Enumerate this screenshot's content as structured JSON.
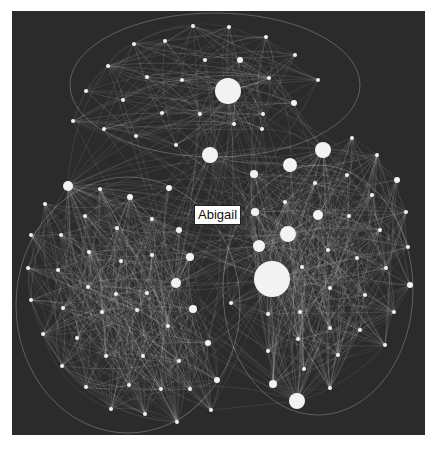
{
  "figure": {
    "background_color": "#2b2b2b",
    "page_color": "#ffffff",
    "edge_color": "#e8e8e8",
    "node_color": "#f2f2f2",
    "highlight_label": {
      "text": "Abigail",
      "x": 194,
      "y": 205
    }
  },
  "clusters": [
    {
      "name": "top-cluster",
      "hull": {
        "cx": 215,
        "cy": 85,
        "rx": 145,
        "ry": 72
      },
      "nodes": [
        [
          193,
          26,
          2
        ],
        [
          229,
          27,
          2
        ],
        [
          266,
          37,
          2
        ],
        [
          134,
          44,
          2
        ],
        [
          165,
          41,
          2
        ],
        [
          240,
          60,
          3
        ],
        [
          205,
          60,
          2
        ],
        [
          295,
          55,
          2
        ],
        [
          108,
          66,
          2
        ],
        [
          147,
          77,
          2
        ],
        [
          182,
          80,
          2
        ],
        [
          228,
          91,
          13
        ],
        [
          269,
          78,
          2
        ],
        [
          318,
          80,
          2
        ],
        [
          86,
          91,
          2
        ],
        [
          123,
          100,
          2
        ],
        [
          162,
          113,
          2
        ],
        [
          200,
          114,
          2
        ],
        [
          234,
          124,
          2
        ],
        [
          263,
          114,
          2
        ],
        [
          294,
          103,
          3
        ],
        [
          73,
          121,
          2
        ],
        [
          104,
          129,
          2
        ],
        [
          136,
          136,
          2
        ],
        [
          176,
          145,
          2
        ],
        [
          210,
          155,
          8
        ],
        [
          262,
          129,
          2
        ]
      ]
    },
    {
      "name": "right-cluster",
      "hull": {
        "cx": 318,
        "cy": 290,
        "rx": 95,
        "ry": 125
      },
      "nodes": [
        [
          323,
          150,
          8
        ],
        [
          352,
          138,
          2
        ],
        [
          377,
          155,
          2
        ],
        [
          290,
          165,
          7
        ],
        [
          254,
          174,
          4
        ],
        [
          347,
          175,
          2
        ],
        [
          315,
          183,
          2
        ],
        [
          397,
          180,
          3
        ],
        [
          372,
          195,
          2
        ],
        [
          285,
          202,
          2
        ],
        [
          318,
          215,
          5
        ],
        [
          255,
          212,
          4
        ],
        [
          349,
          216,
          2
        ],
        [
          406,
          212,
          2
        ],
        [
          288,
          234,
          8
        ],
        [
          259,
          246,
          6
        ],
        [
          380,
          230,
          2
        ],
        [
          408,
          247,
          2
        ],
        [
          328,
          250,
          2
        ],
        [
          302,
          267,
          2
        ],
        [
          357,
          258,
          2
        ],
        [
          386,
          268,
          2
        ],
        [
          272,
          279,
          18
        ],
        [
          410,
          285,
          3
        ],
        [
          330,
          288,
          2
        ],
        [
          365,
          295,
          2
        ],
        [
          300,
          312,
          2
        ],
        [
          268,
          314,
          2
        ],
        [
          394,
          312,
          2
        ],
        [
          231,
          303,
          2
        ],
        [
          330,
          328,
          2
        ],
        [
          360,
          330,
          2
        ],
        [
          298,
          339,
          2
        ],
        [
          385,
          345,
          2
        ],
        [
          268,
          351,
          2
        ],
        [
          338,
          355,
          2
        ],
        [
          304,
          369,
          2
        ],
        [
          273,
          384,
          4
        ],
        [
          330,
          388,
          2
        ],
        [
          297,
          401,
          8
        ]
      ]
    },
    {
      "name": "left-cluster",
      "hull": {
        "cx": 128,
        "cy": 305,
        "rx": 112,
        "ry": 128
      },
      "nodes": [
        [
          68,
          186,
          5
        ],
        [
          100,
          189,
          2
        ],
        [
          130,
          197,
          3
        ],
        [
          169,
          188,
          3
        ],
        [
          45,
          204,
          2
        ],
        [
          85,
          216,
          2
        ],
        [
          117,
          228,
          2
        ],
        [
          152,
          219,
          2
        ],
        [
          179,
          230,
          3
        ],
        [
          31,
          235,
          2
        ],
        [
          61,
          235,
          2
        ],
        [
          89,
          252,
          2
        ],
        [
          121,
          261,
          2
        ],
        [
          152,
          255,
          2
        ],
        [
          190,
          257,
          4
        ],
        [
          28,
          268,
          2
        ],
        [
          58,
          270,
          2
        ],
        [
          88,
          287,
          2
        ],
        [
          116,
          294,
          2
        ],
        [
          147,
          293,
          2
        ],
        [
          176,
          283,
          5
        ],
        [
          31,
          300,
          2
        ],
        [
          63,
          308,
          2
        ],
        [
          102,
          312,
          2
        ],
        [
          137,
          310,
          2
        ],
        [
          168,
          326,
          2
        ],
        [
          193,
          309,
          4
        ],
        [
          43,
          334,
          2
        ],
        [
          77,
          338,
          2
        ],
        [
          106,
          356,
          2
        ],
        [
          143,
          356,
          2
        ],
        [
          179,
          361,
          2
        ],
        [
          208,
          343,
          3
        ],
        [
          62,
          366,
          2
        ],
        [
          86,
          387,
          2
        ],
        [
          129,
          385,
          2
        ],
        [
          161,
          389,
          2
        ],
        [
          190,
          389,
          2
        ],
        [
          217,
          380,
          3
        ],
        [
          111,
          409,
          2
        ],
        [
          145,
          414,
          2
        ],
        [
          177,
          422,
          2
        ],
        [
          211,
          410,
          2
        ]
      ]
    }
  ],
  "hubs": [
    [
      272,
      279
    ],
    [
      228,
      91
    ],
    [
      288,
      234
    ],
    [
      323,
      150
    ],
    [
      297,
      401
    ],
    [
      210,
      155
    ],
    [
      176,
      283
    ],
    [
      68,
      186
    ],
    [
      259,
      246
    ]
  ]
}
